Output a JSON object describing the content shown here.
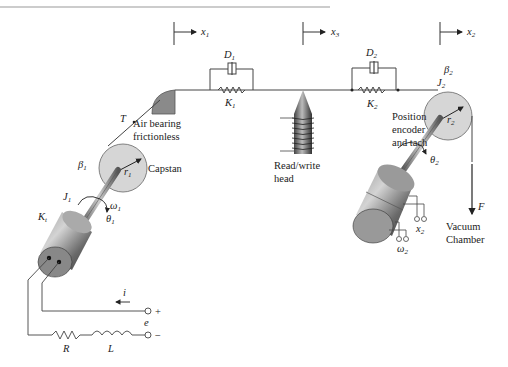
{
  "diagram": {
    "type": "tape drive mechanical/electrical schematic",
    "references": {
      "x1": {
        "sym": "x",
        "sub": "1"
      },
      "x3": {
        "sym": "x",
        "sub": "3"
      },
      "x2": {
        "sym": "x",
        "sub": "2"
      }
    },
    "dampers": {
      "d1": {
        "sym": "D",
        "sub": "1"
      },
      "d2": {
        "sym": "D",
        "sub": "2"
      }
    },
    "springs": {
      "k1": {
        "sym": "K",
        "sub": "1"
      },
      "k2": {
        "sym": "K",
        "sub": "2"
      }
    },
    "tension": "T",
    "air_bearing": {
      "line1": "Air bearing",
      "line2": "frictionless"
    },
    "read_write_head": {
      "line1": "Read/write",
      "line2": "head"
    },
    "position_encoder": {
      "line1": "Position",
      "line2": "encoder",
      "line3": "and tach"
    },
    "capstan": {
      "label": "Capstan",
      "beta": {
        "sym": "β",
        "sub": "1"
      },
      "radius": {
        "sym": "r",
        "sub": "1"
      },
      "inertia": {
        "sym": "J",
        "sub": "1"
      },
      "omega": {
        "sym": "ω",
        "sub": "1"
      },
      "theta": {
        "sym": "θ",
        "sub": "1"
      },
      "motor_constant": {
        "sym": "K",
        "sub": "t"
      }
    },
    "reel": {
      "beta": {
        "sym": "β",
        "sub": "2"
      },
      "radius": {
        "sym": "r",
        "sub": "2"
      },
      "inertia": {
        "sym": "J",
        "sub": "2"
      },
      "theta": {
        "sym": "θ",
        "sub": "2"
      },
      "x_out": {
        "sym": "x",
        "sub": "2"
      },
      "omega_out": {
        "sym": "ω",
        "sub": "2"
      }
    },
    "force": "F",
    "vacuum": {
      "line1": "Vacuum",
      "line2": "Chamber"
    },
    "circuit": {
      "current": "i",
      "voltage": "e",
      "plus": "+",
      "minus": "−",
      "resistor": "R",
      "inductor": "L"
    }
  }
}
